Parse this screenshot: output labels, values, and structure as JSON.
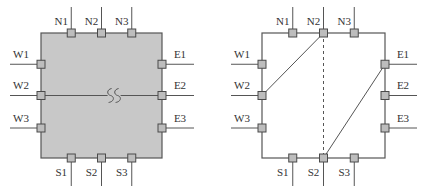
{
  "diagrams": [
    {
      "id": "left",
      "description": "Gray filled switch block with W2-E2 horizontal wire and break symbol",
      "fill_color": "#c8c8c8",
      "terminals": {
        "north": [
          "N1",
          "N2",
          "N3"
        ],
        "west": [
          "W1",
          "W2",
          "W3"
        ],
        "east": [
          "E1",
          "E2",
          "E3"
        ],
        "south": [
          "S1",
          "S2",
          "S3"
        ]
      },
      "connections": [
        {
          "from": "W2",
          "to": "E2",
          "style": "solid",
          "break_symbol": "SS"
        }
      ]
    },
    {
      "id": "right",
      "description": "Unfilled switch block with diagonal connections",
      "fill_color": "#ffffff",
      "terminals": {
        "north": [
          "N1",
          "N2",
          "N3"
        ],
        "west": [
          "W1",
          "W2",
          "W3"
        ],
        "east": [
          "E1",
          "E2",
          "E3"
        ],
        "south": [
          "S1",
          "S2",
          "S3"
        ]
      },
      "connections": [
        {
          "from": "W2",
          "to": "N2",
          "style": "solid"
        },
        {
          "from": "N2",
          "to": "S2",
          "style": "dashed"
        },
        {
          "from": "S2",
          "to": "E1",
          "style": "solid"
        }
      ]
    }
  ],
  "colors": {
    "terminal_fill": "#bdbdbd",
    "terminal_stroke": "#4a4a4a",
    "wire": "#555555",
    "label": "#333333"
  }
}
